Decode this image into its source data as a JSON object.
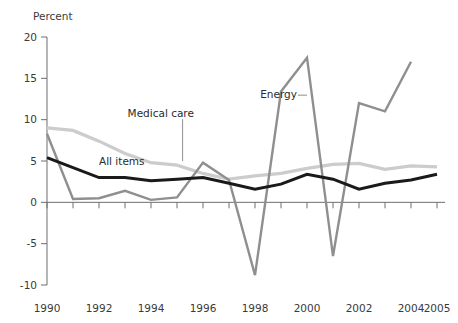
{
  "chart_data": {
    "type": "line",
    "title": "",
    "xlabel": "",
    "ylabel": "Percent",
    "x": [
      1990,
      1991,
      1992,
      1993,
      1994,
      1995,
      1996,
      1997,
      1998,
      1999,
      2000,
      2001,
      2002,
      2003,
      2004,
      2005
    ],
    "xlim": [
      1990,
      2005
    ],
    "ylim": [
      -10,
      20
    ],
    "ytick_labels": [
      "20",
      "15",
      "10",
      "5",
      "0",
      "-5",
      "-10"
    ],
    "ytick_values": [
      20,
      15,
      10,
      5,
      0,
      -5,
      -10
    ],
    "xtick_labels": [
      "1990",
      "1992",
      "1994",
      "1996",
      "1998",
      "2000",
      "2002",
      "2004",
      "2005"
    ],
    "xtick_values": [
      1990,
      1992,
      1994,
      1996,
      1998,
      2000,
      2002,
      2004,
      2005
    ],
    "grid": false,
    "legend_position": "inline-annotations",
    "series": [
      {
        "name": "Medical care",
        "color": "#cccccc",
        "width": 3.2,
        "values": [
          9.0,
          8.7,
          7.4,
          5.9,
          4.8,
          4.5,
          3.5,
          2.8,
          3.2,
          3.5,
          4.1,
          4.6,
          4.7,
          4.0,
          4.4,
          4.3
        ]
      },
      {
        "name": "Energy",
        "color": "#8f8f8f",
        "width": 2.4,
        "values": [
          8.3,
          0.4,
          0.5,
          1.4,
          0.3,
          0.6,
          4.8,
          2.7,
          -8.8,
          13.4,
          17.5,
          -6.5,
          12.0,
          11.0,
          17.0,
          null
        ]
      },
      {
        "name": "All items",
        "color": "#1a1a1a",
        "width": 3.0,
        "values": [
          5.4,
          4.2,
          3.0,
          3.0,
          2.6,
          2.8,
          3.0,
          2.3,
          1.6,
          2.2,
          3.4,
          2.8,
          1.6,
          2.3,
          2.7,
          3.4
        ]
      }
    ],
    "annotations": [
      {
        "text": "Medical care",
        "x": 1993.1,
        "y": 10.3,
        "leader_to_x": 1995.0,
        "leader_to_y": 5.0,
        "anchor": "start"
      },
      {
        "text": "All items",
        "x": 1992.0,
        "y": 4.55,
        "leader_to_x": null,
        "leader_to_y": null,
        "anchor": "start"
      },
      {
        "text": "Energy",
        "x": 1998.2,
        "y": 12.6,
        "leader_to_x": 2000.0,
        "leader_to_y": 12.6,
        "anchor": "start"
      }
    ]
  }
}
